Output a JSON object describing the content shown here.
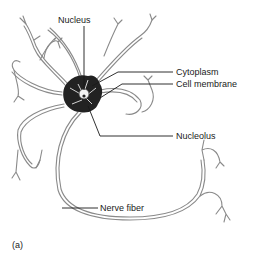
{
  "figure": {
    "panel_label": "(a)",
    "labels": {
      "nucleus": "Nucleus",
      "cytoplasm": "Cytoplasm",
      "cell_membrane": "Cell membrane",
      "nucleolus": "Nucleolus",
      "nerve_fiber": "Nerve fiber"
    },
    "colors": {
      "background": "#ffffff",
      "ink": "#1a1a1a",
      "outline": "#8a8a8a"
    }
  }
}
